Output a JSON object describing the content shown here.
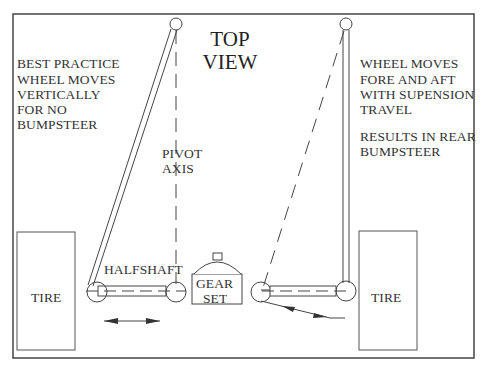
{
  "diagram": {
    "title_line1": "TOP",
    "title_line2": "VIEW",
    "left_note": {
      "line1": "BEST PRACTICE",
      "line2": "WHEEL MOVES",
      "line3": "VERTICALLY",
      "line4": "FOR NO",
      "line5": "BUMPSTEER"
    },
    "right_note": {
      "line1": "WHEEL MOVES",
      "line2": "FORE AND AFT",
      "line3": "WITH SUPENSION",
      "line4": "TRAVEL",
      "line5": "RESULTS IN REAR",
      "line6": "BUMPSTEER"
    },
    "pivot_axis": {
      "line1": "PIVOT",
      "line2": "AXIS"
    },
    "halfshaft_label": "HALFSHAFT",
    "gear_set": {
      "line1": "GEAR",
      "line2": "SET"
    },
    "left_tire_label": "TIRE",
    "right_tire_label": "TIRE",
    "colors": {
      "stroke": "#333333",
      "border": "#444444",
      "background": "#ffffff"
    }
  }
}
